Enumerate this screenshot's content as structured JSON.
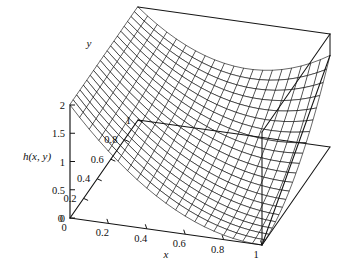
{
  "figure": {
    "background_color": "#ffffff",
    "line_color": "#111111",
    "width": 347,
    "height": 274
  },
  "chart_data": {
    "type": "surface",
    "title": "",
    "subtitle": "",
    "xlabel": "x",
    "ylabel": "y",
    "zlabel": "h(x, y)",
    "xlim": [
      0,
      1
    ],
    "ylim": [
      0,
      1
    ],
    "zlim": [
      0,
      2
    ],
    "xticks": [
      0,
      0.2,
      0.4,
      0.6,
      0.8,
      1
    ],
    "yticks": [
      0,
      0.2,
      0.4,
      0.6,
      0.8,
      1
    ],
    "zticks": [
      0,
      0.5,
      1,
      1.5,
      2
    ],
    "xtick_labels": [
      "0",
      "0.2",
      "0.4",
      "0.6",
      "0.8",
      "1"
    ],
    "ytick_labels": [
      "0",
      "0.2",
      "0.4",
      "0.6",
      "0.8",
      "1"
    ],
    "ztick_labels": [
      "0",
      "0.5",
      "1",
      "1.5",
      "2"
    ],
    "grid": false,
    "legend": false,
    "legend_position": "none",
    "mesh_divisions_x": 20,
    "mesh_divisions_y": 20,
    "wireframe": true,
    "surface_fill": "#ffffff",
    "corner_values": {
      "x0_y0": 2.0,
      "x0_y1": 2.0,
      "x1_y0": 0.0,
      "x1_y1": 1.6
    },
    "view": {
      "azimuth_deg": -52,
      "elevation_deg": 22
    }
  },
  "axes": {
    "x_axis_name": "x-axis",
    "y_axis_name": "y-axis",
    "z_axis_name": "h-axis"
  }
}
